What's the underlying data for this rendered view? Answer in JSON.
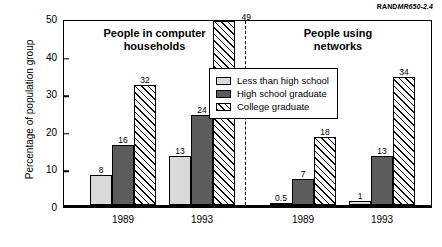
{
  "source_id": {
    "prefix": "RAND",
    "code": "MR650-2.4"
  },
  "axis": {
    "ylabel": "Percentage of population group",
    "yticks": [
      "0",
      "10",
      "20",
      "30",
      "40",
      "50"
    ]
  },
  "legend": {
    "items": [
      {
        "label": "Less than high school",
        "swatch": "light-gray-swatch",
        "color": "#d9d9d9"
      },
      {
        "label": "High school graduate",
        "swatch": "dark-gray-swatch",
        "color": "#5c5c5c"
      },
      {
        "label": "College graduate",
        "swatch": "hatched-swatch",
        "color": "#ffffff"
      }
    ]
  },
  "panels": [
    {
      "title_line1": "People in computer",
      "title_line2": "households",
      "groups": [
        {
          "year": "1989",
          "values": [
            "8",
            "16",
            "32"
          ]
        },
        {
          "year": "1993",
          "values": [
            "13",
            "24",
            "49"
          ]
        }
      ]
    },
    {
      "title_line1": "People using",
      "title_line2": "networks",
      "groups": [
        {
          "year": "1989",
          "values": [
            "0.5",
            "7",
            "18"
          ]
        },
        {
          "year": "1993",
          "values": [
            "1",
            "13",
            "34"
          ]
        }
      ]
    }
  ],
  "chart_data": {
    "type": "bar",
    "title": "",
    "xlabel": "",
    "ylabel": "Percentage of population group",
    "ylim": [
      0,
      50
    ],
    "yticks": [
      0,
      10,
      20,
      30,
      40,
      50
    ],
    "grid": false,
    "legend_position": "center",
    "panels": [
      {
        "name": "People in computer households",
        "categories": [
          "1989",
          "1993"
        ],
        "series": [
          {
            "name": "Less than high school",
            "values": [
              8,
              13
            ]
          },
          {
            "name": "High school graduate",
            "values": [
              16,
              24
            ]
          },
          {
            "name": "College graduate",
            "values": [
              32,
              49
            ]
          }
        ]
      },
      {
        "name": "People using networks",
        "categories": [
          "1989",
          "1993"
        ],
        "series": [
          {
            "name": "Less than high school",
            "values": [
              0.5,
              1
            ]
          },
          {
            "name": "High school graduate",
            "values": [
              7,
              13
            ]
          },
          {
            "name": "College graduate",
            "values": [
              18,
              34
            ]
          }
        ]
      }
    ],
    "annotations": [
      "RANDMR650-2.4"
    ]
  }
}
